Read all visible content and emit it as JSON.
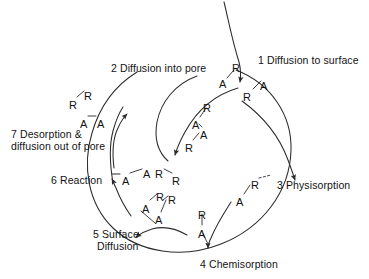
{
  "figure": {
    "name": "heterogeneous-catalysis-cycle",
    "background_color": "#ffffff",
    "ink_color": "#121212",
    "line_color": "#2b2b2b"
  },
  "steps": [
    {
      "id": "step-1",
      "label": "1 Diffusion to surface",
      "x": 258,
      "y": 54
    },
    {
      "id": "step-2",
      "label": "2 Diffusion into pore",
      "x": 111,
      "y": 62
    },
    {
      "id": "step-3",
      "label": "3 Physisorption",
      "x": 277,
      "y": 179
    },
    {
      "id": "step-4",
      "label": "4 Chemisorption",
      "x": 200,
      "y": 258
    },
    {
      "id": "step-5-line1",
      "label": "5 Surface",
      "x": 93,
      "y": 228
    },
    {
      "id": "step-5-line2",
      "label": "Diffusion",
      "x": 97,
      "y": 240
    },
    {
      "id": "step-6",
      "label": "6 Reaction",
      "x": 51,
      "y": 174
    },
    {
      "id": "step-7-line1",
      "label": "7 Desorption &",
      "x": 11,
      "y": 128
    },
    {
      "id": "step-7-line2",
      "label": "diffusion out of pore",
      "x": 11,
      "y": 140
    }
  ],
  "atoms": [
    {
      "id": "atom-s1-r-top",
      "text": "R",
      "x": 232,
      "y": 63
    },
    {
      "id": "atom-s1-a-left",
      "text": "A",
      "x": 219,
      "y": 79
    },
    {
      "id": "atom-s1-r-low",
      "text": "R",
      "x": 243,
      "y": 92
    },
    {
      "id": "atom-s1-a-right",
      "text": "A",
      "x": 260,
      "y": 81
    },
    {
      "id": "atom-s2-r-upper",
      "text": "R",
      "x": 203,
      "y": 103
    },
    {
      "id": "atom-s2-a-upper",
      "text": "A",
      "x": 192,
      "y": 120
    },
    {
      "id": "atom-s2-a-lower",
      "text": "A",
      "x": 200,
      "y": 130
    },
    {
      "id": "atom-s2-r-lower",
      "text": "R",
      "x": 185,
      "y": 143
    },
    {
      "id": "atom-s3-r",
      "text": "R",
      "x": 251,
      "y": 180
    },
    {
      "id": "atom-s3-a",
      "text": "A",
      "x": 236,
      "y": 197
    },
    {
      "id": "atom-s4-r",
      "text": "R",
      "x": 198,
      "y": 210
    },
    {
      "id": "atom-s4-a",
      "text": "A",
      "x": 198,
      "y": 229
    },
    {
      "id": "atom-s5-a-upper",
      "text": "A",
      "x": 142,
      "y": 204
    },
    {
      "id": "atom-s5-r-upper",
      "text": "R",
      "x": 156,
      "y": 192
    },
    {
      "id": "atom-s5-r-right",
      "text": "R",
      "x": 168,
      "y": 195
    },
    {
      "id": "atom-s5-a-lower",
      "text": "A",
      "x": 155,
      "y": 215
    },
    {
      "id": "atom-s6-a-left",
      "text": "A",
      "x": 122,
      "y": 176
    },
    {
      "id": "atom-s6-a-mid",
      "text": "A",
      "x": 143,
      "y": 169
    },
    {
      "id": "atom-s6-r-mid",
      "text": "R",
      "x": 155,
      "y": 169
    },
    {
      "id": "atom-s6-r-right",
      "text": "R",
      "x": 172,
      "y": 176
    },
    {
      "id": "atom-s7-r-left",
      "text": "R",
      "x": 69,
      "y": 100
    },
    {
      "id": "atom-s7-r-right",
      "text": "R",
      "x": 84,
      "y": 91
    },
    {
      "id": "atom-s7-a-left",
      "text": "A",
      "x": 80,
      "y": 119
    },
    {
      "id": "atom-s7-a-right",
      "text": "A",
      "x": 97,
      "y": 119
    }
  ]
}
